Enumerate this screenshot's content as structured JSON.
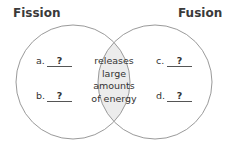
{
  "diagram": {
    "type": "venn",
    "sets": [
      {
        "name": "Fission",
        "unique_items": [
          {
            "letter": "a.",
            "value": "?"
          },
          {
            "letter": "b.",
            "value": "?"
          }
        ]
      },
      {
        "name": "Fusion",
        "unique_items": [
          {
            "letter": "c.",
            "value": "?"
          },
          {
            "letter": "d.",
            "value": "?"
          }
        ]
      }
    ],
    "intersection": {
      "lines": [
        "releases",
        "large",
        "amounts",
        "of energy"
      ]
    },
    "colors": {
      "outline": "#9a9a9a",
      "intersection_fill": "#ececec",
      "text": "#333333"
    }
  }
}
